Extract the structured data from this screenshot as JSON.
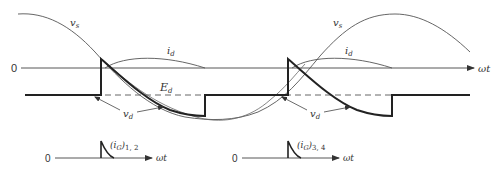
{
  "figure": {
    "type": "waveform diagram",
    "colors": {
      "ink": "#2a2a2a",
      "thin": "#4a4a4a",
      "background": "#ffffff"
    }
  },
  "main_plot": {
    "zero_label": "0",
    "axis_label": "ωt",
    "labels": {
      "vs_left": "v",
      "vs_left_sub": "s",
      "vs_right": "v",
      "vs_right_sub": "s",
      "id_left": "i",
      "id_left_sub": "d",
      "id_right": "i",
      "id_right_sub": "d",
      "Ed": "E",
      "Ed_sub": "d",
      "vd_left": "v",
      "vd_left_sub": "d",
      "vd_right": "v",
      "vd_right_sub": "d"
    }
  },
  "gate_plots": [
    {
      "zero_label": "0",
      "axis_label": "ωt",
      "label_main": "(i",
      "label_sub": "G",
      "label_tail": ")",
      "label_index": "1, 2"
    },
    {
      "zero_label": "0",
      "axis_label": "ωt",
      "label_main": "(i",
      "label_sub": "G",
      "label_tail": ")",
      "label_index": "3, 4"
    }
  ]
}
